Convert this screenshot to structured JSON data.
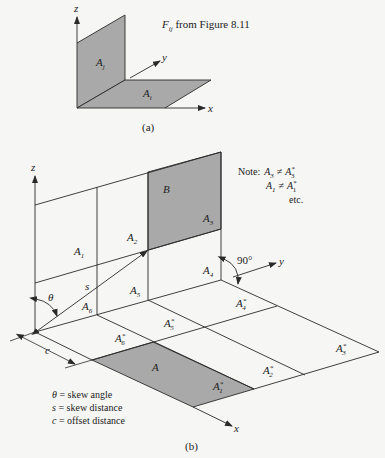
{
  "figure_a": {
    "caption": "(a)",
    "title_prefix": "F",
    "title_sub": "ij",
    "title_suffix": " from Figure 8.11",
    "axes": {
      "x": "x",
      "y": "y",
      "z": "z"
    },
    "surfaces": [
      {
        "name": "A",
        "sub": "j"
      },
      {
        "name": "A",
        "sub": "i"
      }
    ],
    "colors": {
      "shade": "#a9a9a9",
      "line": "#2a2a2a"
    }
  },
  "figure_b": {
    "caption": "(b)",
    "axes": {
      "x": "x",
      "y": "y",
      "z": "z"
    },
    "wall_labels": [
      {
        "name": "A",
        "sub": "1"
      },
      {
        "name": "A",
        "sub": "2"
      },
      {
        "name": "A",
        "sub": "3"
      },
      {
        "name": "A",
        "sub": "4"
      },
      {
        "name": "A",
        "sub": "5"
      },
      {
        "name": "A",
        "sub": "6"
      }
    ],
    "floor_labels": [
      {
        "name": "A",
        "sub": "1",
        "sup": "*"
      },
      {
        "name": "A",
        "sub": "2",
        "sup": "*"
      },
      {
        "name": "A",
        "sub": "3",
        "sup": "*"
      },
      {
        "name": "A",
        "sub": "4",
        "sup": "*"
      },
      {
        "name": "A",
        "sub": "5",
        "sup": "*"
      },
      {
        "name": "A",
        "sub": "6",
        "sup": "*"
      }
    ],
    "shaded_wall": "B",
    "shaded_floor": "A",
    "angle_label": "90°",
    "theta": "θ",
    "skew": "s",
    "offset": "c",
    "note": {
      "prefix": "Note:",
      "line1": {
        "lhs": "A",
        "lhs_sub": "3",
        "op": "≠",
        "rhs": "A",
        "rhs_sub": "3",
        "rhs_sup": "*"
      },
      "line2": {
        "lhs": "A",
        "lhs_sub": "1",
        "op": "≠",
        "rhs": "A",
        "rhs_sub": "1",
        "rhs_sup": "*"
      },
      "line3": "etc."
    },
    "legend": [
      {
        "symbol": "θ",
        "text": " = skew angle"
      },
      {
        "symbol": "s",
        "text": " = skew distance"
      },
      {
        "symbol": "c",
        "text": " = offset distance"
      }
    ]
  }
}
